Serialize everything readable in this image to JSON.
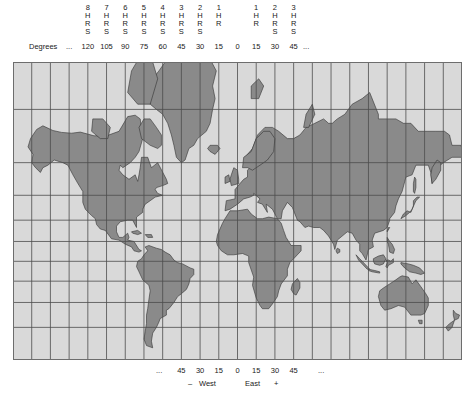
{
  "map": {
    "title": "World time zone map",
    "projection": "mercator",
    "colors": {
      "ocean": "#d9d9d9",
      "land": "#8a8a8a",
      "grid": "#4d4d4d",
      "border": "#6d6d6d",
      "coastline": "#333333",
      "text": "#1a1a1a"
    },
    "grid": {
      "interval_degrees": 15,
      "visible": true,
      "lon_min": -180,
      "lon_max": 180,
      "lat_min": -60,
      "lat_max": 82
    }
  },
  "top_axis": {
    "degrees_label": "Degrees",
    "ellipsis_left": "...",
    "ellipsis_right": "...",
    "timezones": [
      {
        "hours": "8",
        "unit": [
          "H",
          "R",
          "S"
        ],
        "degrees": "120",
        "lon": -120
      },
      {
        "hours": "7",
        "unit": [
          "H",
          "R",
          "S"
        ],
        "degrees": "105",
        "lon": -105
      },
      {
        "hours": "6",
        "unit": [
          "H",
          "R",
          "S"
        ],
        "degrees": "90",
        "lon": -90
      },
      {
        "hours": "5",
        "unit": [
          "H",
          "R",
          "S"
        ],
        "degrees": "75",
        "lon": -75
      },
      {
        "hours": "4",
        "unit": [
          "H",
          "R",
          "S"
        ],
        "degrees": "60",
        "lon": -60
      },
      {
        "hours": "3",
        "unit": [
          "H",
          "R",
          "S"
        ],
        "degrees": "45",
        "lon": -45
      },
      {
        "hours": "2",
        "unit": [
          "H",
          "R",
          "S"
        ],
        "degrees": "30",
        "lon": -30
      },
      {
        "hours": "1",
        "unit": [
          "H",
          "R"
        ],
        "degrees": "15",
        "lon": -15
      },
      {
        "hours": "",
        "unit": [],
        "degrees": "0",
        "lon": 0
      },
      {
        "hours": "1",
        "unit": [
          "H",
          "R"
        ],
        "degrees": "15",
        "lon": 15
      },
      {
        "hours": "2",
        "unit": [
          "H",
          "R",
          "S"
        ],
        "degrees": "30",
        "lon": 30
      },
      {
        "hours": "3",
        "unit": [
          "H",
          "R",
          "S"
        ],
        "degrees": "45",
        "lon": 45
      }
    ]
  },
  "bottom_axis": {
    "ellipsis_left": "...",
    "ellipsis_right": "...",
    "degrees": [
      {
        "value": "45",
        "lon": -45
      },
      {
        "value": "30",
        "lon": -30
      },
      {
        "value": "15",
        "lon": -15
      },
      {
        "value": "0",
        "lon": 0
      },
      {
        "value": "15",
        "lon": 15
      },
      {
        "value": "30",
        "lon": 30
      },
      {
        "value": "45",
        "lon": 45
      }
    ],
    "minus_sign": "–",
    "west_label": "West",
    "east_label": "East",
    "plus_sign": "+"
  }
}
